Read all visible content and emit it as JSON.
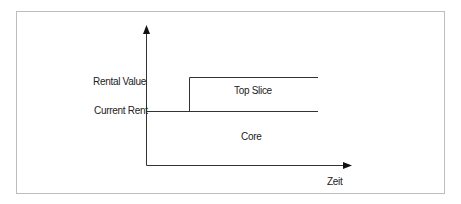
{
  "diagram": {
    "y_labels": {
      "rental_value": "Rental Value",
      "current_rent": "Current Rent"
    },
    "regions": {
      "top_slice": "Top Slice",
      "core": "Core"
    },
    "x_axis_label": "Zeit",
    "line_color": "#333333"
  }
}
